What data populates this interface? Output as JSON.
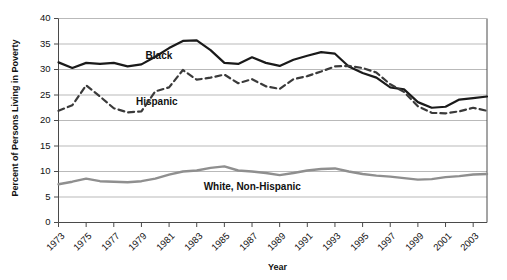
{
  "chart_data": {
    "type": "line",
    "title": "",
    "xlabel": "Year",
    "ylabel": "Percent of Persons Living in Poverty",
    "grid": "horizontal",
    "legend_position": "inline-labels",
    "xlim": [
      1973,
      2004
    ],
    "ylim": [
      0,
      40
    ],
    "ytick_values": [
      0,
      5,
      10,
      15,
      20,
      25,
      30,
      35,
      40
    ],
    "ytick_labels": [
      "0",
      "5",
      "10",
      "15",
      "20",
      "25",
      "30",
      "35",
      "40"
    ],
    "xtick_values": [
      1973,
      1975,
      1977,
      1979,
      1981,
      1983,
      1985,
      1987,
      1989,
      1991,
      1993,
      1995,
      1997,
      1999,
      2001,
      2003
    ],
    "xtick_labels": [
      "1973",
      "1975",
      "1977",
      "1979",
      "1981",
      "1983",
      "1985",
      "1987",
      "1989",
      "1991",
      "1993",
      "1995",
      "1997",
      "1999",
      "2001",
      "2003"
    ],
    "x": [
      1973,
      1974,
      1975,
      1976,
      1977,
      1978,
      1979,
      1980,
      1981,
      1982,
      1983,
      1984,
      1985,
      1986,
      1987,
      1988,
      1989,
      1990,
      1991,
      1992,
      1993,
      1994,
      1995,
      1996,
      1997,
      1998,
      1999,
      2000,
      2001,
      2002,
      2003,
      2004
    ],
    "series": [
      {
        "name": "Black",
        "label": "Black",
        "color": "#1a1a1a",
        "style": "solid",
        "width": 2.2,
        "values": [
          31.4,
          30.3,
          31.3,
          31.1,
          31.3,
          30.6,
          31.0,
          32.5,
          34.2,
          35.6,
          35.7,
          33.8,
          31.3,
          31.1,
          32.4,
          31.3,
          30.7,
          31.9,
          32.7,
          33.4,
          33.1,
          30.6,
          29.3,
          28.4,
          26.5,
          26.1,
          23.6,
          22.5,
          22.7,
          24.1,
          24.4,
          24.7
        ]
      },
      {
        "name": "Hispanic",
        "label": "Hispanic",
        "color": "#3a3a3a",
        "style": "dashed",
        "width": 2.2,
        "values": [
          21.9,
          23.0,
          26.9,
          24.7,
          22.4,
          21.6,
          21.8,
          25.7,
          26.5,
          29.9,
          28.0,
          28.4,
          29.0,
          27.3,
          28.1,
          26.7,
          26.2,
          28.1,
          28.7,
          29.6,
          30.6,
          30.7,
          30.3,
          29.4,
          27.1,
          25.6,
          22.8,
          21.5,
          21.4,
          21.8,
          22.5,
          21.9
        ]
      },
      {
        "name": "White, Non-Hispanic",
        "label": "White, Non-Hispanic",
        "color": "#8f8f8f",
        "style": "solid",
        "width": 2.4,
        "values": [
          7.5,
          8.0,
          8.6,
          8.1,
          8.0,
          7.9,
          8.1,
          8.6,
          9.4,
          10.0,
          10.2,
          10.7,
          11.0,
          10.2,
          10.0,
          9.7,
          9.3,
          9.7,
          10.2,
          10.5,
          10.6,
          10.0,
          9.5,
          9.2,
          9.0,
          8.7,
          8.4,
          8.5,
          8.9,
          9.1,
          9.4,
          9.5
        ]
      }
    ],
    "annotations": [
      {
        "text": "Black",
        "x": 1979.3,
        "y": 32.6
      },
      {
        "text": "Hispanic",
        "x": 1978.6,
        "y": 23.6
      },
      {
        "text": "White, Non-Hispanic",
        "x": 1983.5,
        "y": 6.9
      }
    ]
  }
}
